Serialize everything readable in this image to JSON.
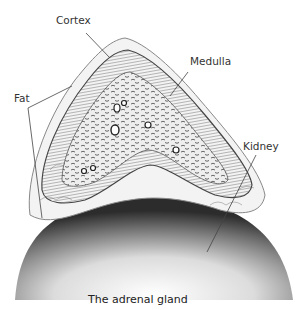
{
  "figure": {
    "caption": "The adrenal gland",
    "labels": {
      "cortex": "Cortex",
      "medulla": "Medulla",
      "fat": "Fat",
      "kidney": "Kidney"
    }
  }
}
